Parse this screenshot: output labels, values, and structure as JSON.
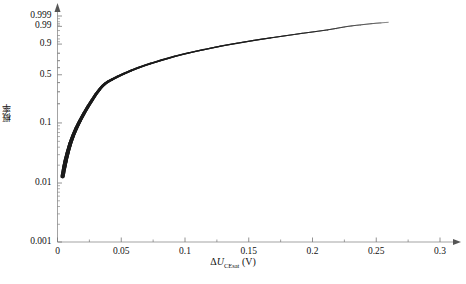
{
  "chart_data": {
    "type": "line",
    "title": "",
    "subtitle": "",
    "xlabel": "ΔU_CEsat (V)",
    "xlabel_parts": {
      "delta": "Δ",
      "symbol": "U",
      "subscript": "CEsat",
      "unit": "(V)"
    },
    "ylabel": "概率",
    "y_scale": "weibull-probability",
    "x_scale": "linear",
    "xlim": [
      0,
      0.3
    ],
    "ylim": [
      0.001,
      0.999
    ],
    "grid": false,
    "legend": null,
    "xticks": [
      0,
      0.05,
      0.1,
      0.15,
      0.2,
      0.25,
      0.3
    ],
    "xtick_labels": [
      "0",
      "0.05",
      "0.1",
      "0.15",
      "0.2",
      "0.25",
      "0.3"
    ],
    "x_minor_step": 0.025,
    "yticks": [
      0.001,
      0.01,
      0.1,
      0.5,
      0.9,
      0.99,
      0.999
    ],
    "ytick_labels": [
      "0.001",
      "0.01",
      "0.1",
      "0.5",
      "0.9",
      "0.99",
      "0.999"
    ],
    "axis_arrows": {
      "x": true,
      "y": true
    },
    "series": [
      {
        "name": "cumulative probability",
        "color": "#1a1a1a",
        "x": [
          0.004,
          0.0052,
          0.0066,
          0.0082,
          0.01,
          0.0122,
          0.0148,
          0.0176,
          0.0206,
          0.0238,
          0.027,
          0.03,
          0.0328,
          0.0352,
          0.0375,
          0.04,
          0.043,
          0.047,
          0.052,
          0.058,
          0.065,
          0.073,
          0.082,
          0.092,
          0.103,
          0.115,
          0.128,
          0.141,
          0.154,
          0.167,
          0.18,
          0.192,
          0.203,
          0.212,
          0.219,
          0.225,
          0.231,
          0.238,
          0.246,
          0.254,
          0.26
        ],
        "y": [
          0.013,
          0.018,
          0.025,
          0.034,
          0.046,
          0.062,
          0.083,
          0.108,
          0.14,
          0.18,
          0.225,
          0.275,
          0.32,
          0.36,
          0.39,
          0.415,
          0.44,
          0.475,
          0.515,
          0.56,
          0.61,
          0.66,
          0.71,
          0.76,
          0.805,
          0.845,
          0.88,
          0.908,
          0.93,
          0.947,
          0.96,
          0.97,
          0.977,
          0.982,
          0.986,
          0.989,
          0.991,
          0.9925,
          0.994,
          0.995,
          0.9955
        ]
      }
    ],
    "annotations": []
  },
  "figure": {
    "caption": "",
    "axis_color": "#999999",
    "tick_color": "#777777",
    "text_color": "#111111",
    "background": "#ffffff"
  }
}
